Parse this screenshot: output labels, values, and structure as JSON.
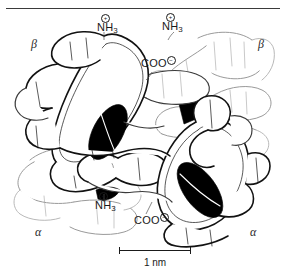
{
  "figure": {
    "type": "molecular-structure-diagram",
    "background_color": "#ffffff",
    "outline_color": "#1a1a1a",
    "heme_color": "#000000",
    "background_chain_color": "#9a9a9a"
  },
  "top_rule": {
    "present": true,
    "color": "#3a3a3a"
  },
  "subunit_labels": [
    {
      "id": "beta-top-left",
      "text": "β",
      "x": 31,
      "y": 44
    },
    {
      "id": "beta-top-right",
      "text": "β",
      "x": 258,
      "y": 44
    },
    {
      "id": "alpha-bottom-left",
      "text": "α",
      "x": 35,
      "y": 232
    },
    {
      "id": "alpha-bottom-right",
      "text": "α",
      "x": 250,
      "y": 232
    }
  ],
  "terminus_labels": [
    {
      "id": "amino-terminus-top-left",
      "base": "NH",
      "subscript": "3",
      "charge": "+",
      "x": 97,
      "y": 29
    },
    {
      "id": "amino-terminus-top-right",
      "base": "NH",
      "subscript": "3",
      "charge": "+",
      "x": 162,
      "y": 28
    },
    {
      "id": "carboxyl-terminus-top",
      "base": "COO",
      "subscript": "",
      "charge": "−",
      "x": 141,
      "y": 62
    },
    {
      "id": "amino-terminus-bottom",
      "base": "NH",
      "subscript": "3",
      "charge": "+",
      "x": 95,
      "y": 207
    },
    {
      "id": "carboxyl-terminus-bottom",
      "base": "COO",
      "subscript": "",
      "charge": "−",
      "x": 134,
      "y": 219
    }
  ],
  "scale_bar": {
    "caption": "1 nm",
    "length_px": 72
  },
  "heme_groups": [
    {
      "id": "heme-upper-left",
      "orientation": "face-on-tilted"
    },
    {
      "id": "heme-upper-right",
      "orientation": "edge-on"
    },
    {
      "id": "heme-lower-right",
      "orientation": "face-on-tilted"
    },
    {
      "id": "heme-lower-center",
      "orientation": "partially-occluded"
    }
  ]
}
